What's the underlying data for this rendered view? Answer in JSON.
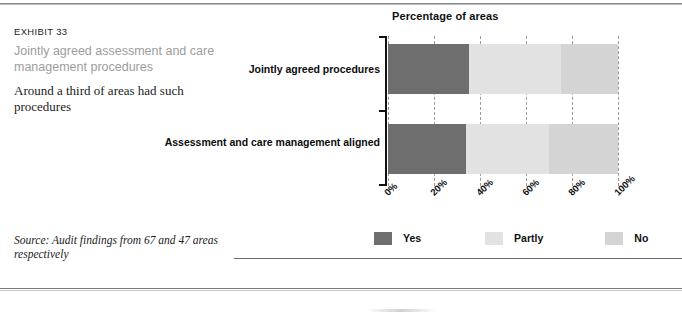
{
  "exhibit": {
    "number": "EXHIBIT 33",
    "title": "Jointly agreed assessment and care management procedures",
    "subtitle": "Around a third of areas had such procedures",
    "source": "Source: Audit findings from 67 and 47 areas respectively"
  },
  "colors": {
    "yes": "#6e6e6e",
    "partly": "#e2e2e2",
    "no": "#d4d4d4",
    "axis": "#111111",
    "gridline": "#9a9a9a",
    "title_gray": "#9d9d9d"
  },
  "chart_data": {
    "type": "bar",
    "orientation": "horizontal",
    "stacked": true,
    "title": "Percentage of areas",
    "xlabel": "",
    "ylabel": "",
    "xlim": [
      0,
      100
    ],
    "grid": true,
    "legend_position": "bottom",
    "categories": [
      "Jointly agreed procedures",
      "Assessment and care management aligned"
    ],
    "tick_labels": [
      "0%",
      "20%",
      "40%",
      "60%",
      "80%",
      "100%"
    ],
    "tick_values": [
      0,
      20,
      40,
      60,
      80,
      100
    ],
    "series": [
      {
        "name": "Yes",
        "color": "#6e6e6e",
        "values": [
          35,
          34
        ]
      },
      {
        "name": "Partly",
        "color": "#e2e2e2",
        "values": [
          40,
          36
        ]
      },
      {
        "name": "No",
        "color": "#d4d4d4",
        "values": [
          25,
          30
        ]
      }
    ]
  }
}
